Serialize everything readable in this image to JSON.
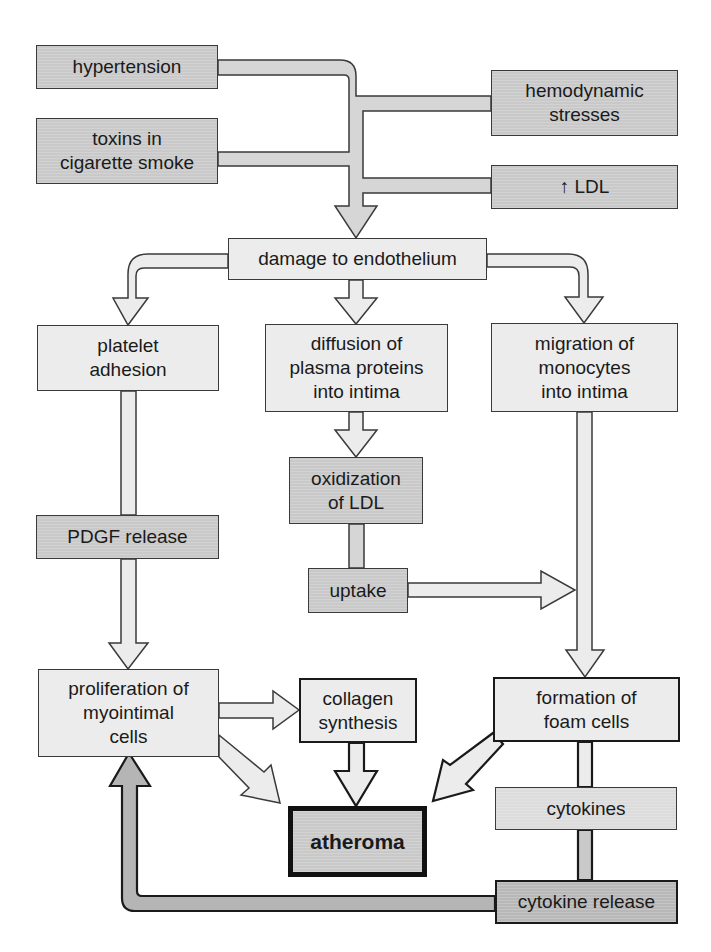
{
  "diagram": {
    "colors": {
      "risk_factor_fill": "#c9c9c9",
      "process_fill": "#ececec",
      "mediator_fill": "#c9c9c9",
      "outline": "#3a3a3a",
      "outcome_fill": "#b8b8b8"
    },
    "nodes": {
      "hypertension": "hypertension",
      "toxins": "toxins in\ncigarette smoke",
      "hemodynamic": "hemodynamic\nstresses",
      "ldl": "↑ LDL",
      "damage": "damage to endothelium",
      "platelet": "platelet\nadhesion",
      "diffusion": "diffusion of\nplasma proteins\ninto intima",
      "migration": "migration of\nmonocytes\ninto intima",
      "oxidization": "oxidization\nof LDL",
      "pdgf": "PDGF release",
      "uptake": "uptake",
      "proliferation": "proliferation of\nmyointimal\ncells",
      "collagen": "collagen\nsynthesis",
      "foam": "formation of\nfoam cells",
      "atheroma": "atheroma",
      "cytokines": "cytokines",
      "cytokine_release": "cytokine release"
    },
    "edges": [
      {
        "from": "hypertension",
        "to": "damage"
      },
      {
        "from": "toxins",
        "to": "damage"
      },
      {
        "from": "hemodynamic",
        "to": "damage"
      },
      {
        "from": "ldl",
        "to": "damage"
      },
      {
        "from": "damage",
        "to": "platelet"
      },
      {
        "from": "damage",
        "to": "diffusion"
      },
      {
        "from": "damage",
        "to": "migration"
      },
      {
        "from": "platelet",
        "to": "pdgf"
      },
      {
        "from": "pdgf",
        "to": "proliferation"
      },
      {
        "from": "diffusion",
        "to": "oxidization"
      },
      {
        "from": "oxidization",
        "to": "uptake"
      },
      {
        "from": "uptake",
        "to": "migration-path"
      },
      {
        "from": "migration",
        "to": "foam"
      },
      {
        "from": "proliferation",
        "to": "collagen"
      },
      {
        "from": "proliferation",
        "to": "atheroma"
      },
      {
        "from": "collagen",
        "to": "atheroma"
      },
      {
        "from": "foam",
        "to": "atheroma"
      },
      {
        "from": "foam",
        "to": "cytokines"
      },
      {
        "from": "cytokines",
        "to": "cytokine_release"
      },
      {
        "from": "cytokine_release",
        "to": "proliferation"
      }
    ]
  }
}
